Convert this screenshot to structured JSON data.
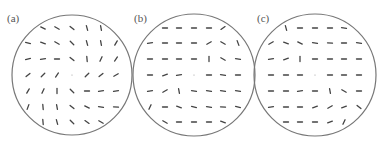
{
  "figure": {
    "width": 385,
    "height": 146,
    "circle_color": "#777777",
    "tick_color": "#444444",
    "label_color": "#555555",
    "tick_length": 5,
    "grid": {
      "row_y": [
        28,
        43,
        59,
        75,
        91,
        107,
        122
      ],
      "col_dx": [
        -44,
        -29,
        -15,
        0,
        15,
        29,
        44
      ],
      "row_cols": [
        [
          1,
          2,
          3,
          4,
          5
        ],
        [
          0,
          1,
          2,
          3,
          4,
          5,
          6
        ],
        [
          0,
          1,
          2,
          3,
          4,
          5,
          6
        ],
        [
          0,
          1,
          2,
          3,
          4,
          5,
          6
        ],
        [
          0,
          1,
          2,
          3,
          4,
          5,
          6
        ],
        [
          0,
          1,
          2,
          3,
          4,
          5,
          6
        ],
        [
          1,
          2,
          3,
          4,
          5
        ]
      ]
    },
    "panels": [
      {
        "id": "a",
        "label": "(a)",
        "label_pos": [
          7,
          13
        ],
        "circle": {
          "cx": 72,
          "cy": 75,
          "r": 60
        },
        "angles": [
          [
            25,
            30,
            40,
            75,
            80
          ],
          [
            15,
            20,
            30,
            45,
            75,
            80,
            -60
          ],
          [
            -15,
            -10,
            0,
            40,
            85,
            -65,
            -55
          ],
          [
            -40,
            -45,
            -55,
            "dot",
            -45,
            -40,
            -30
          ],
          [
            -60,
            -65,
            90,
            45,
            0,
            -10,
            -10
          ],
          [
            -70,
            85,
            80,
            40,
            25,
            10,
            5
          ],
          [
            85,
            75,
            45,
            35,
            30
          ]
        ]
      },
      {
        "id": "b",
        "label": "(b)",
        "label_pos": [
          134,
          13
        ],
        "circle": {
          "cx": 194,
          "cy": 75,
          "r": 61
        },
        "angles": [
          [
            0,
            0,
            0,
            0,
            -35
          ],
          [
            -10,
            0,
            0,
            0,
            -30,
            30,
            70
          ],
          [
            0,
            0,
            0,
            0,
            90,
            30,
            10
          ],
          [
            0,
            -20,
            -10,
            "dot",
            0,
            10,
            0
          ],
          [
            -10,
            -30,
            80,
            10,
            10,
            10,
            10
          ],
          [
            -65,
            0,
            20,
            15,
            10,
            5,
            15
          ],
          [
            30,
            0,
            0,
            0,
            20
          ]
        ]
      },
      {
        "id": "c",
        "label": "(c)",
        "label_pos": [
          257,
          13
        ],
        "circle": {
          "cx": 315,
          "cy": 75,
          "r": 61
        },
        "angles": [
          [
            75,
            0,
            0,
            0,
            10
          ],
          [
            -30,
            20,
            25,
            10,
            5,
            0,
            10
          ],
          [
            -10,
            -20,
            90,
            0,
            0,
            0,
            0
          ],
          [
            0,
            0,
            0,
            "dot",
            0,
            0,
            0
          ],
          [
            0,
            0,
            -10,
            0,
            80,
            30,
            0
          ],
          [
            -10,
            0,
            0,
            -20,
            -30,
            -20,
            40
          ],
          [
            0,
            0,
            0,
            -20,
            -65
          ]
        ]
      }
    ]
  }
}
